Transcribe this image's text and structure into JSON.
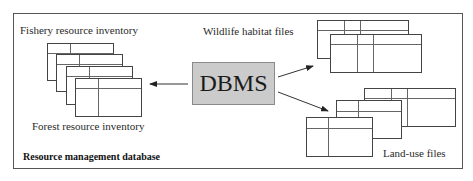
{
  "diagram": {
    "title": "Resource management database",
    "center_node": {
      "label": "DBMS",
      "fill": "#cbcbcb"
    },
    "groups": [
      {
        "id": "fishery",
        "label": "Fishery resource inventory"
      },
      {
        "id": "forest",
        "label": "Forest resource inventory"
      },
      {
        "id": "wildlife",
        "label": "Wildlife habitat files"
      },
      {
        "id": "landuse",
        "label": "Land-use files"
      }
    ],
    "edges": [
      {
        "from": "DBMS",
        "to": "fishery/forest inventory stack",
        "direction": "left"
      },
      {
        "from": "DBMS",
        "to": "Wildlife habitat files",
        "direction": "up-right"
      },
      {
        "from": "DBMS",
        "to": "Land-use files",
        "direction": "down-right"
      }
    ]
  }
}
